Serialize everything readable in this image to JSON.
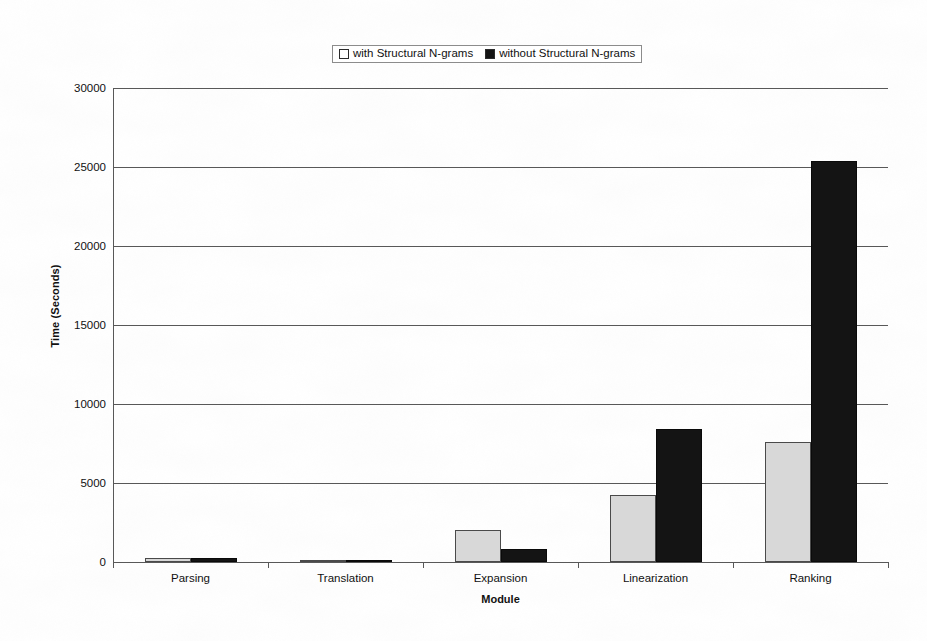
{
  "chart_data": {
    "type": "bar",
    "title": "",
    "xlabel": "Module",
    "ylabel": "Time (Seconds)",
    "categories": [
      "Parsing",
      "Translation",
      "Expansion",
      "Linearization",
      "Ranking"
    ],
    "series": [
      {
        "name": "with Structural N-grams",
        "color": "#d8d8d8",
        "values": [
          250,
          100,
          2000,
          4250,
          7600
        ]
      },
      {
        "name": "without Structural N-grams",
        "color": "#141414",
        "values": [
          230,
          90,
          800,
          8400,
          25400
        ]
      }
    ],
    "ylim": [
      0,
      30000
    ],
    "yticks": [
      0,
      5000,
      10000,
      15000,
      20000,
      25000,
      30000
    ],
    "ytick_labels": [
      "0",
      "5000",
      "10000",
      "15000",
      "20000",
      "25000",
      "30000"
    ],
    "grid": "horizontal",
    "legend_position": "top-center",
    "legend_entries": [
      {
        "marker": "open-square-icon",
        "label": "with Structural N-grams"
      },
      {
        "marker": "filled-square-icon",
        "label": "without Structural N-grams"
      }
    ]
  }
}
